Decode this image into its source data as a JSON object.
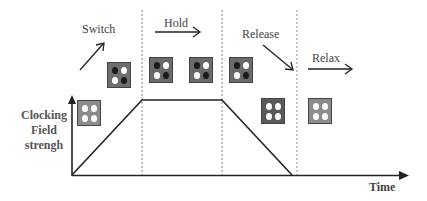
{
  "labels": {
    "switch": "Switch",
    "hold": "Hold",
    "release": "Release",
    "relax": "Relax",
    "y_axis": [
      "Clocking",
      "Field",
      "strengh"
    ],
    "x_axis": "Time"
  },
  "phases": [
    "Switch",
    "Hold",
    "Release",
    "Relax"
  ],
  "colors": {
    "axis": "#222222",
    "dashed": "#888888",
    "cell_light": "#8c8c8c",
    "cell_mid": "#6e6e6e",
    "cell_dark": "#595959",
    "dot_white": "#ffffff",
    "dot_black": "#1a1a1a"
  },
  "cells": [
    {
      "name": "relaxed-cell-initial",
      "x": 77,
      "y": 100,
      "fill": "#8c8c8c",
      "dots": [
        "white",
        "white",
        "white",
        "white"
      ]
    },
    {
      "name": "switch-cell",
      "x": 107,
      "y": 62,
      "fill": "#6e6e6e",
      "dots": [
        "black",
        "white",
        "white",
        "black"
      ]
    },
    {
      "name": "hold-cell-1",
      "x": 149,
      "y": 57,
      "fill": "#6a6a6a",
      "dots": [
        "black",
        "white",
        "white",
        "black"
      ]
    },
    {
      "name": "hold-cell-2",
      "x": 189,
      "y": 57,
      "fill": "#6a6a6a",
      "dots": [
        "black",
        "white",
        "white",
        "black"
      ]
    },
    {
      "name": "hold-cell-3",
      "x": 229,
      "y": 57,
      "fill": "#6a6a6a",
      "dots": [
        "black",
        "white",
        "white",
        "black"
      ]
    },
    {
      "name": "release-cell",
      "x": 261,
      "y": 98,
      "fill": "#595959",
      "dots": [
        "white",
        "white",
        "white",
        "white"
      ]
    },
    {
      "name": "relax-cell",
      "x": 308,
      "y": 98,
      "fill": "#8c8c8c",
      "dots": [
        "white",
        "white",
        "white",
        "white"
      ]
    }
  ]
}
